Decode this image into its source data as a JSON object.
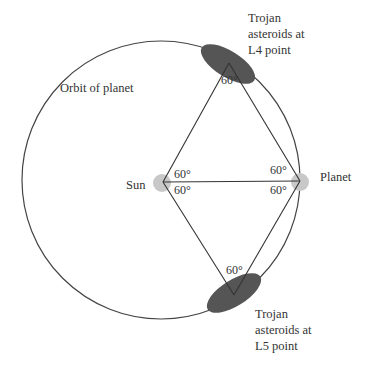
{
  "diagram": {
    "labels": {
      "orbit": "Orbit of planet",
      "sun": "Sun",
      "planet": "Planet",
      "l4_line1": "Trojan",
      "l4_line2": "asteroids at",
      "l4_line3": "L4 point",
      "l5_line1": "Trojan",
      "l5_line2": "asteroids at",
      "l5_line3": "L5 point"
    },
    "angles": {
      "l4_top": "60°",
      "sun_upper": "60°",
      "sun_lower": "60°",
      "planet_upper": "60°",
      "planet_lower": "60°",
      "l5_bottom": "60°"
    },
    "colors": {
      "line": "#333333",
      "asteroid_fill": "#555555",
      "body_glow": "#c8c8c8"
    }
  }
}
